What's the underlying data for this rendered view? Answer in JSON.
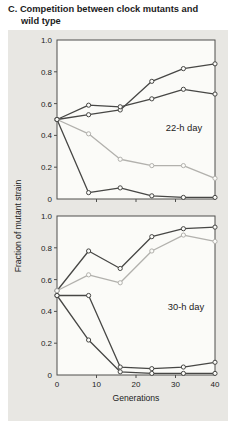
{
  "figure": {
    "title_line1": "C. Competition between clock mutants and",
    "title_line2": "wild type",
    "xlabel": "Generations",
    "ylabel": "Fraction of mutant strain"
  },
  "colors": {
    "box_bg": "#e8e7e3",
    "plot_bg": "#fbfbf8",
    "frame": "#4f4f4d",
    "dark_line": "#474745",
    "light_line": "#b2b1ad",
    "text": "#1c1c1c"
  },
  "chart_data": [
    {
      "type": "line",
      "panel_label": "22-h day",
      "xlabel": "Generations",
      "ylabel": "Fraction of mutant strain",
      "xlim": [
        0,
        40
      ],
      "ylim": [
        0,
        1.0
      ],
      "grid": false,
      "x": [
        0,
        8,
        16,
        24,
        32,
        40
      ],
      "xticks": [
        {
          "v": 0,
          "label": "0"
        },
        {
          "v": 10,
          "label": "10"
        },
        {
          "v": 20,
          "label": "20"
        },
        {
          "v": 30,
          "label": "30"
        },
        {
          "v": 40,
          "label": "40"
        }
      ],
      "yticks": [
        {
          "v": 1.0,
          "label": "1.0"
        },
        {
          "v": 0.8,
          "label": "0.8"
        },
        {
          "v": 0.6,
          "label": "0.6"
        },
        {
          "v": 0.4,
          "label": "0.4"
        },
        {
          "v": 0.2,
          "label": "0.2"
        },
        {
          "v": 0,
          "label": "0"
        }
      ],
      "series": [
        {
          "name": "rising-steep",
          "color": "dark",
          "values": [
            0.5,
            0.53,
            0.56,
            0.74,
            0.82,
            0.85
          ]
        },
        {
          "name": "rising-moderate",
          "color": "dark",
          "values": [
            0.5,
            0.59,
            0.58,
            0.63,
            0.69,
            0.66
          ]
        },
        {
          "name": "declining-gradual",
          "color": "light",
          "values": [
            0.5,
            0.41,
            0.25,
            0.21,
            0.21,
            0.13
          ]
        },
        {
          "name": "declining-steep",
          "color": "dark",
          "values": [
            0.5,
            0.04,
            0.07,
            0.02,
            0.01,
            0.01
          ]
        }
      ],
      "label_pos": {
        "x": 176,
        "y_value": 0.43
      }
    },
    {
      "type": "line",
      "panel_label": "30-h day",
      "xlabel": "Generations",
      "ylabel": "Fraction of mutant strain",
      "xlim": [
        0,
        40
      ],
      "ylim": [
        0,
        1.0
      ],
      "grid": false,
      "x": [
        0,
        8,
        16,
        24,
        32,
        40
      ],
      "xticks": [
        {
          "v": 0,
          "label": "0"
        },
        {
          "v": 10,
          "label": "10"
        },
        {
          "v": 20,
          "label": "20"
        },
        {
          "v": 30,
          "label": "30"
        },
        {
          "v": 40,
          "label": "40"
        }
      ],
      "yticks": [
        {
          "v": 1.0,
          "label": "1.0"
        },
        {
          "v": 0.8,
          "label": "0.8"
        },
        {
          "v": 0.6,
          "label": "0.6"
        },
        {
          "v": 0.4,
          "label": "0.4"
        },
        {
          "v": 0.2,
          "label": "0.2"
        },
        {
          "v": 0,
          "label": "0"
        }
      ],
      "series": [
        {
          "name": "rising-steep",
          "color": "dark",
          "values": [
            0.53,
            0.78,
            0.67,
            0.87,
            0.92,
            0.93
          ]
        },
        {
          "name": "rising-moderate",
          "color": "light",
          "values": [
            0.53,
            0.63,
            0.58,
            0.78,
            0.88,
            0.84
          ]
        },
        {
          "name": "flat-then-drop",
          "color": "dark",
          "values": [
            0.5,
            0.5,
            0.05,
            0.04,
            0.05,
            0.08
          ]
        },
        {
          "name": "declining-steep",
          "color": "dark",
          "values": [
            0.5,
            0.22,
            0.02,
            0.01,
            0.01,
            0.01
          ]
        }
      ],
      "label_pos": {
        "x": 178,
        "y_value": 0.41
      }
    }
  ]
}
